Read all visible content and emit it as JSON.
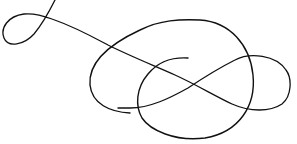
{
  "image": {
    "description": "Calligraphic flourish line drawing: a single black pen stroke with a small loop at upper left, a long diagonal, an infinity/figure-eight loop, and a large oval ending in an inner hook",
    "background_color": "#ffffff",
    "stroke_color": "#111111"
  }
}
